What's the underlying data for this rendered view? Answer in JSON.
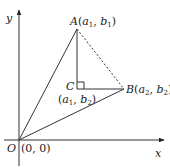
{
  "diagram": {
    "axes": {
      "x_label": "x",
      "y_label": "y",
      "origin_label": "O",
      "origin_coords": "(0, 0)"
    },
    "points": {
      "A": {
        "name": "A",
        "coords": "(a1, b1)",
        "label_prefix": "A(",
        "v1": "a",
        "s1": "1",
        "sep": ", ",
        "v2": "b",
        "s2": "1",
        "suffix": ")"
      },
      "B": {
        "name": "B",
        "coords": "(a2, b2)",
        "label_prefix": "B(",
        "v1": "a",
        "s1": "2",
        "sep": ", ",
        "v2": "b",
        "s2": "2",
        "suffix": ")"
      },
      "C": {
        "name": "C",
        "coords": "(a1, b2)",
        "label_prefix": "(",
        "v1": "a",
        "s1": "1",
        "sep": ", ",
        "v2": "b",
        "s2": "2",
        "suffix": ")"
      }
    },
    "segments": [
      {
        "from": "O",
        "to": "A",
        "style": "solid"
      },
      {
        "from": "O",
        "to": "B",
        "style": "solid"
      },
      {
        "from": "A",
        "to": "C",
        "style": "solid"
      },
      {
        "from": "C",
        "to": "B",
        "style": "solid"
      },
      {
        "from": "A",
        "to": "B",
        "style": "dashed"
      }
    ],
    "right_angle_at": "C"
  }
}
